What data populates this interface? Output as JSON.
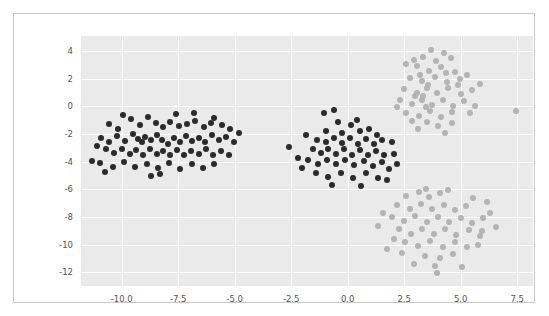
{
  "chart_data": {
    "type": "scatter",
    "title": "",
    "xlabel": "",
    "ylabel": "",
    "xlim": [
      -11.8,
      8.2
    ],
    "ylim": [
      -13.0,
      5.1
    ],
    "grid": true,
    "legend": "none",
    "xticks": [
      "-10.0",
      "-7.5",
      "-5.0",
      "-2.5",
      "0.0",
      "2.5",
      "5.0",
      "7.5"
    ],
    "xtick_values": [
      -10.0,
      -7.5,
      -5.0,
      -2.5,
      0.0,
      2.5,
      5.0,
      7.5
    ],
    "yticks": [
      "4",
      "2",
      "0",
      "-2",
      "-4",
      "-6",
      "-8",
      "-10",
      "-12"
    ],
    "ytick_values": [
      4,
      2,
      0,
      -2,
      -4,
      -6,
      -8,
      -10,
      -12
    ],
    "colors": {
      "dark": "#2b2b2b",
      "light": "#b4b4b4",
      "plot_background": "#eaeaea",
      "gridline": "#ffffff",
      "figure_background": "#ffffff",
      "figure_border": "#c8c8c8",
      "tick_label": "#555555"
    },
    "marker_size_px": 6,
    "series": [
      {
        "name": "dark-cluster-left",
        "color": "#2b2b2b",
        "points": [
          [
            -10.55,
            -1.25
          ],
          [
            -10.15,
            -1.6
          ],
          [
            -9.6,
            -0.9
          ],
          [
            -9.2,
            -1.35
          ],
          [
            -8.85,
            -0.75
          ],
          [
            -8.5,
            -1.2
          ],
          [
            -8.15,
            -1.5
          ],
          [
            -7.85,
            -1.1
          ],
          [
            -7.45,
            -1.45
          ],
          [
            -7.1,
            -1.3
          ],
          [
            -6.75,
            -1.05
          ],
          [
            -6.35,
            -1.5
          ],
          [
            -6.05,
            -1.2
          ],
          [
            -5.55,
            -1.35
          ],
          [
            -5.2,
            -1.6
          ],
          [
            -10.9,
            -2.25
          ],
          [
            -10.55,
            -2.6
          ],
          [
            -10.2,
            -2.15
          ],
          [
            -9.85,
            -2.5
          ],
          [
            -9.5,
            -2.0
          ],
          [
            -9.3,
            -2.35
          ],
          [
            -9.1,
            -2.6
          ],
          [
            -8.95,
            -2.2
          ],
          [
            -8.7,
            -2.45
          ],
          [
            -8.45,
            -2.05
          ],
          [
            -8.2,
            -2.4
          ],
          [
            -7.95,
            -2.7
          ],
          [
            -7.7,
            -2.3
          ],
          [
            -7.4,
            -2.55
          ],
          [
            -7.15,
            -2.15
          ],
          [
            -6.9,
            -2.5
          ],
          [
            -6.6,
            -2.25
          ],
          [
            -6.3,
            -2.6
          ],
          [
            -6.0,
            -2.1
          ],
          [
            -5.7,
            -2.45
          ],
          [
            -5.4,
            -2.2
          ],
          [
            -5.05,
            -2.55
          ],
          [
            -4.8,
            -1.95
          ],
          [
            -10.7,
            -3.1
          ],
          [
            -10.35,
            -3.4
          ],
          [
            -10.0,
            -3.05
          ],
          [
            -9.65,
            -3.45
          ],
          [
            -9.35,
            -3.15
          ],
          [
            -9.05,
            -3.5
          ],
          [
            -8.75,
            -3.1
          ],
          [
            -8.45,
            -3.45
          ],
          [
            -8.15,
            -3.2
          ],
          [
            -7.85,
            -3.55
          ],
          [
            -7.55,
            -3.15
          ],
          [
            -7.25,
            -3.5
          ],
          [
            -6.95,
            -3.2
          ],
          [
            -6.6,
            -3.45
          ],
          [
            -6.25,
            -3.1
          ],
          [
            -5.95,
            -3.5
          ],
          [
            -5.6,
            -3.25
          ],
          [
            -5.25,
            -3.55
          ],
          [
            -10.95,
            -4.1
          ],
          [
            -10.4,
            -4.35
          ],
          [
            -9.9,
            -4.05
          ],
          [
            -9.4,
            -4.4
          ],
          [
            -8.9,
            -4.15
          ],
          [
            -8.4,
            -4.45
          ],
          [
            -7.9,
            -4.1
          ],
          [
            -7.4,
            -4.5
          ],
          [
            -6.9,
            -4.2
          ],
          [
            -6.4,
            -4.45
          ],
          [
            -5.9,
            -4.15
          ],
          [
            -11.3,
            -3.95
          ],
          [
            -11.1,
            -2.85
          ],
          [
            -10.75,
            -4.75
          ],
          [
            -8.7,
            -5.0
          ],
          [
            -7.6,
            -0.55
          ],
          [
            -6.8,
            -0.5
          ],
          [
            -5.9,
            -0.85
          ],
          [
            -9.95,
            -0.6
          ],
          [
            -8.3,
            -4.9
          ]
        ]
      },
      {
        "name": "dark-cluster-middle",
        "color": "#2b2b2b",
        "points": [
          [
            -1.05,
            -0.45
          ],
          [
            -0.45,
            -1.15
          ],
          [
            -0.95,
            -1.75
          ],
          [
            -0.25,
            -1.95
          ],
          [
            0.15,
            -1.35
          ],
          [
            0.55,
            -1.8
          ],
          [
            0.95,
            -1.6
          ],
          [
            1.3,
            -2.1
          ],
          [
            -1.35,
            -2.4
          ],
          [
            -0.95,
            -2.55
          ],
          [
            -0.6,
            -2.25
          ],
          [
            -0.25,
            -2.65
          ],
          [
            0.1,
            -2.3
          ],
          [
            0.45,
            -2.7
          ],
          [
            0.8,
            -2.35
          ],
          [
            1.15,
            -2.75
          ],
          [
            1.5,
            -2.4
          ],
          [
            -1.55,
            -3.1
          ],
          [
            -1.2,
            -3.4
          ],
          [
            -0.85,
            -3.05
          ],
          [
            -0.5,
            -3.45
          ],
          [
            -0.15,
            -3.1
          ],
          [
            0.2,
            -3.5
          ],
          [
            0.55,
            -3.15
          ],
          [
            0.9,
            -3.5
          ],
          [
            1.25,
            -3.2
          ],
          [
            1.6,
            -3.55
          ],
          [
            -1.75,
            -3.85
          ],
          [
            -1.3,
            -4.15
          ],
          [
            -0.9,
            -3.85
          ],
          [
            -0.5,
            -4.2
          ],
          [
            -0.1,
            -3.9
          ],
          [
            0.3,
            -4.25
          ],
          [
            0.7,
            -3.95
          ],
          [
            1.1,
            -4.3
          ],
          [
            1.5,
            -4.0
          ],
          [
            -1.4,
            -4.85
          ],
          [
            -0.85,
            -5.1
          ],
          [
            -0.3,
            -4.8
          ],
          [
            0.25,
            -5.15
          ],
          [
            0.8,
            -4.85
          ],
          [
            1.35,
            -5.2
          ],
          [
            -2.6,
            -2.95
          ],
          [
            -2.2,
            -3.75
          ],
          [
            -2.0,
            -4.45
          ],
          [
            1.95,
            -2.6
          ],
          [
            2.05,
            -3.45
          ],
          [
            1.85,
            -4.55
          ],
          [
            -0.6,
            -0.25
          ],
          [
            0.4,
            -0.95
          ],
          [
            -0.7,
            -5.7
          ],
          [
            0.6,
            -5.75
          ],
          [
            1.75,
            -5.3
          ],
          [
            -1.85,
            -2.05
          ],
          [
            2.2,
            -4.15
          ]
        ]
      },
      {
        "name": "light-cluster-upper-right",
        "color": "#b4b4b4",
        "points": [
          [
            3.35,
            3.6
          ],
          [
            3.9,
            3.3
          ],
          [
            4.55,
            3.5
          ],
          [
            3.05,
            2.9
          ],
          [
            3.6,
            2.6
          ],
          [
            4.15,
            2.85
          ],
          [
            4.75,
            2.5
          ],
          [
            2.75,
            2.05
          ],
          [
            3.3,
            1.85
          ],
          [
            3.85,
            2.15
          ],
          [
            4.4,
            1.75
          ],
          [
            4.95,
            2.0
          ],
          [
            2.5,
            1.25
          ],
          [
            3.05,
            1.0
          ],
          [
            3.5,
            1.35
          ],
          [
            3.95,
            0.95
          ],
          [
            4.45,
            1.3
          ],
          [
            5.0,
            0.9
          ],
          [
            5.5,
            1.2
          ],
          [
            2.3,
            0.45
          ],
          [
            2.85,
            0.15
          ],
          [
            3.3,
            0.5
          ],
          [
            3.75,
            0.1
          ],
          [
            4.2,
            0.45
          ],
          [
            4.65,
            0.05
          ],
          [
            5.15,
            0.4
          ],
          [
            5.65,
            0.0
          ],
          [
            2.6,
            -0.45
          ],
          [
            3.15,
            -0.7
          ],
          [
            3.65,
            -0.35
          ],
          [
            4.15,
            -0.75
          ],
          [
            4.6,
            -0.4
          ],
          [
            3.5,
            -1.15
          ],
          [
            4.0,
            -1.45
          ],
          [
            4.6,
            -1.2
          ],
          [
            3.35,
            0.75
          ],
          [
            3.45,
            -0.05
          ],
          [
            3.55,
            1.55
          ],
          [
            3.2,
            2.3
          ],
          [
            2.95,
            3.35
          ],
          [
            5.3,
            2.3
          ],
          [
            5.85,
            1.6
          ],
          [
            3.0,
            0.75
          ],
          [
            4.35,
            2.4
          ],
          [
            2.85,
            -1.05
          ],
          [
            7.45,
            -0.35
          ],
          [
            2.6,
            3.05
          ],
          [
            4.25,
            3.9
          ],
          [
            3.7,
            4.1
          ],
          [
            5.4,
            -0.5
          ],
          [
            2.2,
            -0.05
          ],
          [
            4.9,
            1.55
          ],
          [
            3.1,
            -1.6
          ],
          [
            4.3,
            -1.9
          ]
        ]
      },
      {
        "name": "light-cluster-lower-right",
        "color": "#b4b4b4",
        "points": [
          [
            2.6,
            -6.5
          ],
          [
            3.15,
            -6.2
          ],
          [
            3.6,
            -6.55
          ],
          [
            4.1,
            -6.25
          ],
          [
            2.2,
            -7.1
          ],
          [
            2.75,
            -7.4
          ],
          [
            3.25,
            -7.05
          ],
          [
            3.75,
            -7.45
          ],
          [
            4.25,
            -7.15
          ],
          [
            4.75,
            -7.5
          ],
          [
            5.25,
            -7.2
          ],
          [
            1.95,
            -8.0
          ],
          [
            2.5,
            -8.3
          ],
          [
            3.0,
            -7.95
          ],
          [
            3.5,
            -8.35
          ],
          [
            4.0,
            -8.0
          ],
          [
            4.5,
            -8.4
          ],
          [
            5.0,
            -8.05
          ],
          [
            5.5,
            -8.45
          ],
          [
            6.0,
            -8.1
          ],
          [
            2.25,
            -8.9
          ],
          [
            2.8,
            -9.2
          ],
          [
            3.3,
            -8.85
          ],
          [
            3.8,
            -9.25
          ],
          [
            4.3,
            -8.9
          ],
          [
            4.8,
            -9.3
          ],
          [
            5.35,
            -8.95
          ],
          [
            5.85,
            -9.35
          ],
          [
            2.55,
            -9.8
          ],
          [
            3.1,
            -10.1
          ],
          [
            3.65,
            -9.75
          ],
          [
            4.2,
            -10.15
          ],
          [
            4.75,
            -9.85
          ],
          [
            5.3,
            -10.2
          ],
          [
            3.4,
            -10.8
          ],
          [
            4.1,
            -11.0
          ],
          [
            4.65,
            -10.7
          ],
          [
            1.55,
            -7.7
          ],
          [
            1.35,
            -8.65
          ],
          [
            6.3,
            -7.7
          ],
          [
            6.55,
            -8.75
          ],
          [
            3.85,
            -11.55
          ],
          [
            3.95,
            -12.05
          ],
          [
            5.05,
            -11.6
          ],
          [
            2.95,
            -11.4
          ],
          [
            5.75,
            -10.0
          ],
          [
            2.05,
            -9.6
          ],
          [
            3.45,
            -5.95
          ],
          [
            4.45,
            -6.05
          ],
          [
            5.95,
            -9.0
          ],
          [
            6.15,
            -6.95
          ],
          [
            1.75,
            -10.35
          ],
          [
            5.55,
            -6.6
          ],
          [
            2.4,
            -10.6
          ]
        ]
      }
    ]
  }
}
